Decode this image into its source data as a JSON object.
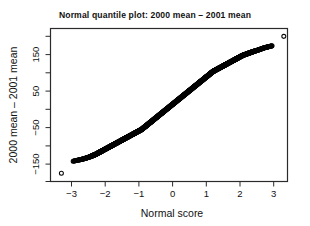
{
  "chart_data": {
    "type": "scatter",
    "title": "Normal quantile plot: 2000 mean – 2001 mean",
    "xlabel": "Normal score",
    "ylabel": "2000 mean – 2001 mean",
    "xlim": [
      -3.55,
      3.55
    ],
    "ylim": [
      -195,
      215
    ],
    "grid": false,
    "legend": null,
    "marker": "open-circle",
    "x_ticks": [
      -3,
      -2,
      -1,
      0,
      1,
      2,
      3
    ],
    "x_tick_labels": [
      "−3",
      "−2",
      "−1",
      "0",
      "1",
      "2",
      "3"
    ],
    "y_ticks": [
      -150,
      -100,
      -50,
      0,
      50,
      100,
      150,
      200
    ],
    "y_tick_labels_major": [
      "−150",
      "−50",
      "50",
      "150"
    ],
    "y_major_ticks": [
      -150,
      -50,
      50,
      150
    ],
    "y_minor_ticks": [
      -100,
      0,
      100,
      200
    ],
    "series": [
      {
        "name": "2000 mean − 2001 mean quantiles",
        "x": [
          -3.3,
          -2.95,
          -2.8,
          -2.7,
          -2.62,
          -2.55,
          -2.49,
          -2.43,
          -2.38,
          -2.33,
          -2.28,
          -2.24,
          -2.2,
          -2.16,
          -2.12,
          -2.08,
          -2.04,
          -2.0,
          -1.96,
          -1.92,
          -1.88,
          -1.84,
          -1.8,
          -1.76,
          -1.72,
          -1.68,
          -1.64,
          -1.6,
          -1.56,
          -1.52,
          -1.48,
          -1.44,
          -1.4,
          -1.36,
          -1.32,
          -1.28,
          -1.24,
          -1.2,
          -1.16,
          -1.12,
          -1.08,
          -1.04,
          -1.0,
          -0.96,
          -0.92,
          -0.88,
          -0.84,
          -0.8,
          -0.76,
          -0.72,
          -0.68,
          -0.64,
          -0.6,
          -0.56,
          -0.52,
          -0.48,
          -0.44,
          -0.4,
          -0.36,
          -0.32,
          -0.28,
          -0.24,
          -0.2,
          -0.16,
          -0.12,
          -0.08,
          -0.04,
          0.0,
          0.04,
          0.08,
          0.12,
          0.16,
          0.2,
          0.24,
          0.28,
          0.32,
          0.36,
          0.4,
          0.44,
          0.48,
          0.52,
          0.56,
          0.6,
          0.64,
          0.68,
          0.72,
          0.76,
          0.8,
          0.84,
          0.88,
          0.92,
          0.96,
          1.0,
          1.04,
          1.08,
          1.12,
          1.16,
          1.2,
          1.24,
          1.28,
          1.32,
          1.36,
          1.4,
          1.44,
          1.48,
          1.52,
          1.56,
          1.6,
          1.64,
          1.68,
          1.72,
          1.76,
          1.8,
          1.84,
          1.88,
          1.92,
          1.96,
          2.0,
          2.04,
          2.08,
          2.14,
          2.2,
          2.26,
          2.32,
          2.38,
          2.45,
          2.52,
          2.58,
          2.64,
          2.7,
          2.78,
          2.86,
          2.95,
          3.3
        ],
        "y": [
          -175,
          -142,
          -139,
          -137,
          -135,
          -133,
          -131,
          -129,
          -127,
          -125,
          -123,
          -121,
          -119,
          -117,
          -115,
          -113,
          -111,
          -109,
          -107,
          -105,
          -103,
          -101,
          -99,
          -97,
          -95,
          -93,
          -91,
          -89,
          -87,
          -85,
          -83,
          -81,
          -79,
          -77,
          -75,
          -73,
          -71,
          -69,
          -67,
          -65,
          -63,
          -61,
          -59,
          -57,
          -55,
          -52,
          -49,
          -46,
          -43,
          -40,
          -37,
          -34,
          -31,
          -28,
          -25,
          -22,
          -19,
          -16,
          -13,
          -10,
          -7,
          -4,
          -1,
          2,
          5,
          8,
          11,
          14,
          17,
          20,
          23,
          26,
          29,
          32,
          35,
          38,
          41,
          44,
          47,
          50,
          53,
          56,
          59,
          62,
          65,
          68,
          71,
          74,
          77,
          80,
          83,
          86,
          89,
          92,
          95,
          98,
          101,
          104,
          106,
          108,
          110,
          112,
          114,
          116,
          118,
          120,
          122,
          124,
          126,
          128,
          130,
          132,
          134,
          136,
          138,
          140,
          142,
          144,
          146,
          148,
          150,
          152,
          154,
          156,
          158,
          160,
          162,
          164,
          166,
          168,
          170,
          172,
          174,
          200
        ]
      }
    ],
    "outliers": [
      {
        "label": "low-outlier",
        "x": -3.3,
        "y": -175
      },
      {
        "label": "high-outlier",
        "x": 3.3,
        "y": 200
      }
    ],
    "n_points_visible": "dense overlapping band"
  }
}
